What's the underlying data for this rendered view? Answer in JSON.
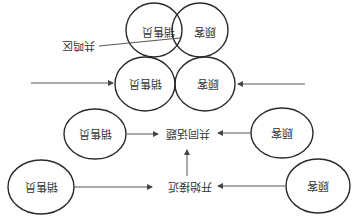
{
  "diagram": {
    "orientation": "rotated-180",
    "colors": {
      "stroke": "#2a2a2a",
      "text": "#333333",
      "arrow": "#555555",
      "background": "#ffffff"
    },
    "stages": [
      {
        "id": "resonance",
        "salesperson": "销售员",
        "customer": "顾客",
        "overlap_label": "共鸣区"
      },
      {
        "id": "contact",
        "salesperson": "销售员",
        "customer": "顾客"
      },
      {
        "id": "common-topic",
        "salesperson": "销售员",
        "customer": "顾客",
        "center_label": "共同话题"
      },
      {
        "id": "approach",
        "salesperson": "销售员",
        "customer": "顾客",
        "center_label": "开始接近"
      }
    ]
  }
}
